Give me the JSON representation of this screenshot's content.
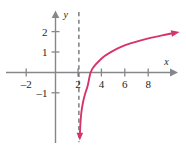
{
  "figure": {
    "name": "logarithmic-function-graph",
    "background_color": "#ffffff"
  },
  "chart_data": {
    "type": "line",
    "title": "",
    "subtitle": "",
    "xlabel": "x",
    "ylabel": "y",
    "xlim": [
      -3.5,
      10.8
    ],
    "ylim": [
      -3.4,
      2.9
    ],
    "xticks": [
      -2,
      2,
      4,
      6,
      8
    ],
    "yticks": [
      -1,
      1,
      2
    ],
    "xtick_labels": [
      "–2",
      "2",
      "4",
      "6",
      "8"
    ],
    "ytick_labels": [
      "–1",
      "1",
      "2"
    ],
    "grid": false,
    "legend": null,
    "curve_color": "#d6356b",
    "axis_color": "#86878a",
    "asymptote_color": "#5d5e61",
    "series": [
      {
        "name": "y = log(x - 2)",
        "color": "#d6356b",
        "arrow_start": "down",
        "arrow_end": "up-right",
        "x": [
          2.08,
          2.12,
          2.2,
          2.35,
          2.55,
          2.75,
          3.0,
          3.3,
          3.7,
          4.2,
          4.8,
          5.6,
          6.4,
          7.3,
          8.2,
          9.2,
          9.9
        ],
        "y": [
          -3.1,
          -2.6,
          -2.0,
          -1.45,
          -1.0,
          -0.65,
          0.0,
          0.3,
          0.55,
          0.8,
          1.02,
          1.25,
          1.42,
          1.57,
          1.7,
          1.82,
          1.9
        ]
      }
    ],
    "annotations": [
      {
        "type": "vertical-asymptote",
        "x": 2,
        "style": "dashed",
        "color": "#5d5e61",
        "y_from": -3.4,
        "y_to": 2.95
      }
    ]
  },
  "axes": {
    "x_axis_name": "x",
    "y_axis_name": "y",
    "x_arrow": true,
    "y_arrow": true
  }
}
